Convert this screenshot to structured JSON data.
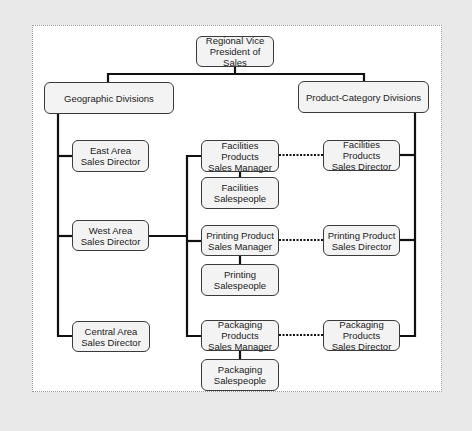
{
  "diagram": {
    "type": "organizational-chart",
    "colors": {
      "background": "#e9e9e9",
      "panel": "#ffffff",
      "box_fill": "#f3f3f3",
      "line": "#111111"
    },
    "nodes": {
      "vp": "Regional Vice\nPresident of Sales",
      "geo": "Geographic Divisions",
      "prod": "Product-Category Divisions",
      "east": "East Area\nSales Director",
      "west": "West Area\nSales Director",
      "central": "Central Area\nSales Director",
      "fac_mgr": "Facilities\nProducts\nSales Manager",
      "fac_sp": "Facilities\nSalespeople",
      "prt_mgr": "Printing Product\nSales Manager",
      "prt_sp": "Printing\nSalespeople",
      "pkg_mgr": "Packaging\nProducts\nSales Manager",
      "pkg_sp": "Packaging\nSalespeople",
      "fac_dir": "Facilities Products\nSales Director",
      "prt_dir": "Printing Product\nSales Director",
      "pkg_dir": "Packaging Products\nSales Director"
    },
    "edges": [
      {
        "from": "vp",
        "to": "geo",
        "style": "solid"
      },
      {
        "from": "vp",
        "to": "prod",
        "style": "solid"
      },
      {
        "from": "geo",
        "to": "east",
        "style": "solid"
      },
      {
        "from": "geo",
        "to": "west",
        "style": "solid"
      },
      {
        "from": "geo",
        "to": "central",
        "style": "solid"
      },
      {
        "from": "west",
        "to": "fac_mgr",
        "style": "solid"
      },
      {
        "from": "west",
        "to": "prt_mgr",
        "style": "solid"
      },
      {
        "from": "west",
        "to": "pkg_mgr",
        "style": "solid"
      },
      {
        "from": "fac_mgr",
        "to": "fac_sp",
        "style": "solid"
      },
      {
        "from": "prt_mgr",
        "to": "prt_sp",
        "style": "solid"
      },
      {
        "from": "pkg_mgr",
        "to": "pkg_sp",
        "style": "solid"
      },
      {
        "from": "prod",
        "to": "fac_dir",
        "style": "solid"
      },
      {
        "from": "prod",
        "to": "prt_dir",
        "style": "solid"
      },
      {
        "from": "prod",
        "to": "pkg_dir",
        "style": "solid"
      },
      {
        "from": "fac_mgr",
        "to": "fac_dir",
        "style": "dotted"
      },
      {
        "from": "prt_mgr",
        "to": "prt_dir",
        "style": "dotted"
      },
      {
        "from": "pkg_mgr",
        "to": "pkg_dir",
        "style": "dotted"
      }
    ]
  }
}
